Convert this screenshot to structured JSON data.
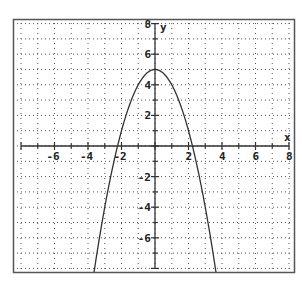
{
  "chart_data": {
    "type": "line",
    "title": "",
    "xlabel": "x",
    "ylabel": "y",
    "xlim": [
      -8,
      8
    ],
    "ylim": [
      -8,
      8
    ],
    "grid": true,
    "grid_style": "dotted, every 1 unit",
    "x_ticks": [
      -6,
      -4,
      -2,
      2,
      4,
      6,
      8
    ],
    "y_ticks": [
      8,
      6,
      4,
      2,
      -2,
      -4,
      -6
    ],
    "x_tick_labels": [
      "-6",
      "-4",
      "-2",
      "2",
      "4",
      "6",
      "8"
    ],
    "y_tick_labels": [
      "8",
      "6",
      "4",
      "2",
      "-2",
      "-4",
      "-6"
    ],
    "series": [
      {
        "name": "y = 5 - x^2",
        "function": "5 - x^2",
        "x": [
          -3.6,
          -3,
          -2.5,
          -2.236,
          -2,
          -1.5,
          -1,
          -0.5,
          0,
          0.5,
          1,
          1.5,
          2,
          2.236,
          2.5,
          3,
          3.6
        ],
        "y": [
          -7.96,
          -4,
          -1.25,
          0,
          1,
          2.75,
          4,
          4.75,
          5,
          4.75,
          4,
          2.75,
          1,
          0,
          -1.25,
          -4,
          -7.96
        ]
      }
    ],
    "legend": "none",
    "colors": {
      "curve": "#333333",
      "axes": "#333333",
      "grid": "#555555",
      "frame": "#555555"
    }
  },
  "labels": {
    "x_axis": "x",
    "y_axis": "y"
  }
}
